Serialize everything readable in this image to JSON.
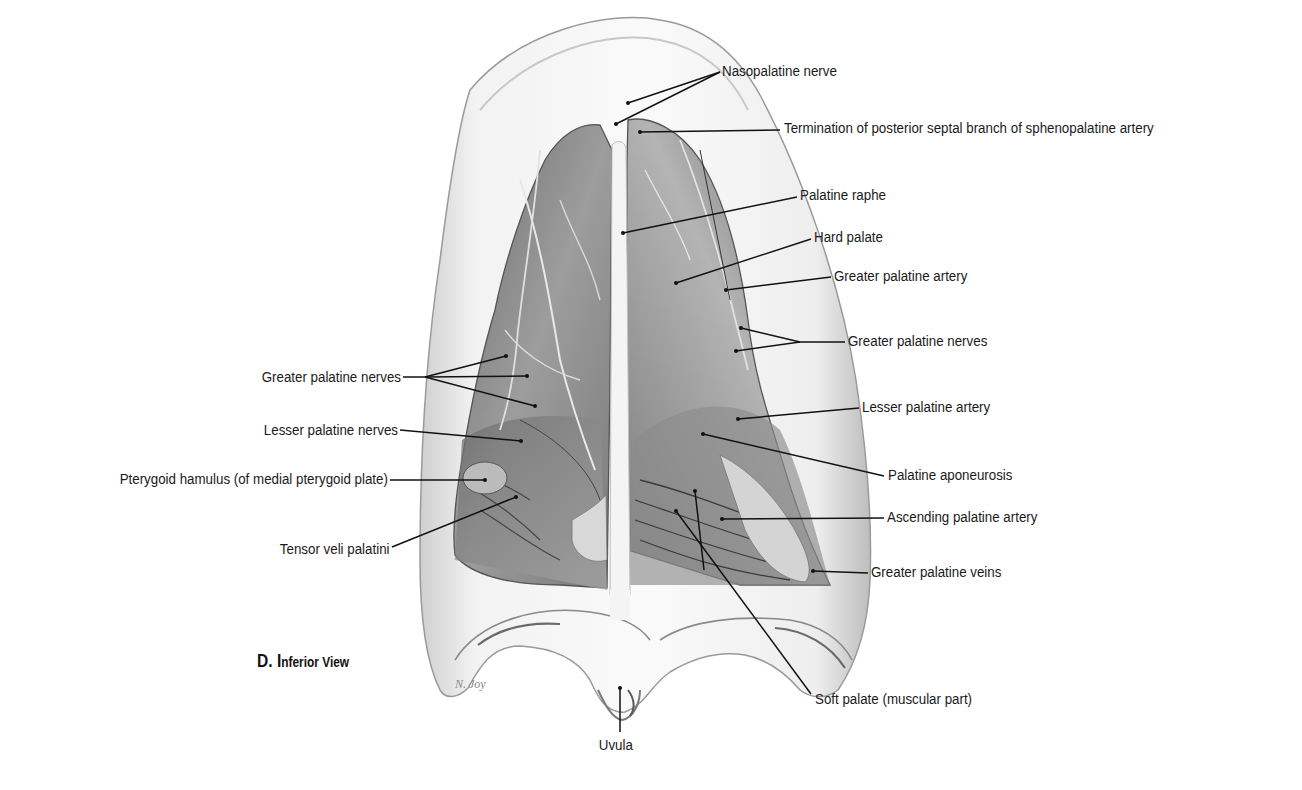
{
  "figure": {
    "caption_prefix": "D. I",
    "caption_rest": "nferior View",
    "caption_full": "D. Inferior View",
    "signature": "N. Joy"
  },
  "labels": {
    "right": [
      {
        "id": "nasopalatine-nerve",
        "text": "Nasopalatine nerve"
      },
      {
        "id": "posterior-septal-termination",
        "text": "Termination of posterior septal branch of sphenopalatine artery"
      },
      {
        "id": "palatine-raphe",
        "text": "Palatine raphe"
      },
      {
        "id": "hard-palate",
        "text": "Hard palate"
      },
      {
        "id": "greater-palatine-artery",
        "text": "Greater palatine artery"
      },
      {
        "id": "greater-palatine-nerves-right",
        "text": "Greater palatine nerves"
      },
      {
        "id": "lesser-palatine-artery",
        "text": "Lesser palatine artery"
      },
      {
        "id": "palatine-aponeurosis",
        "text": "Palatine aponeurosis"
      },
      {
        "id": "ascending-palatine-artery",
        "text": "Ascending palatine artery"
      },
      {
        "id": "greater-palatine-veins",
        "text": "Greater palatine veins"
      },
      {
        "id": "soft-palate",
        "text": "Soft palate (muscular part)"
      }
    ],
    "left": [
      {
        "id": "greater-palatine-nerves-left",
        "text": "Greater palatine nerves"
      },
      {
        "id": "lesser-palatine-nerves",
        "text": "Lesser palatine nerves"
      },
      {
        "id": "pterygoid-hamulus",
        "text": "Pterygoid hamulus (of medial pterygoid plate)"
      },
      {
        "id": "tensor-veli-palatini",
        "text": "Tensor veli palatini"
      }
    ],
    "bottom": [
      {
        "id": "uvula",
        "text": "Uvula"
      }
    ]
  },
  "colors": {
    "leader": "#111111",
    "text": "#1a1a1a",
    "tissue_dark": "#5e5e5e",
    "tissue_mid": "#9a9a9a",
    "gum": "#e6e6e6"
  }
}
